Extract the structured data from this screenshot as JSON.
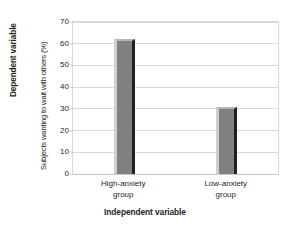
{
  "chart_data": {
    "type": "bar",
    "title": "",
    "categories": [
      "High-anxiety group",
      "Low-anxiety group"
    ],
    "values": [
      62,
      31
    ],
    "xlabel": "Independent variable",
    "ylabel": "Subjects wanting to wait with others (%)",
    "ylim": [
      0,
      70
    ],
    "yticks": [
      0,
      10,
      20,
      30,
      40,
      50,
      60,
      70
    ],
    "ytick_labels": [
      "0",
      "10",
      "20",
      "30",
      "40",
      "50",
      "60",
      "70"
    ],
    "grid": true,
    "legend": "none",
    "bar_color": "#808080",
    "grid_color": "#d9d9d9"
  },
  "axes": {
    "y_outer_label": "Dependent variable",
    "y_inner_label": "Subjects wanting to wait with others (%)",
    "x_title": "Independent variable"
  },
  "categories": [
    {
      "line1": "High-anxiety",
      "line2": "group"
    },
    {
      "line1": "Low-anxiety",
      "line2": "group"
    }
  ]
}
